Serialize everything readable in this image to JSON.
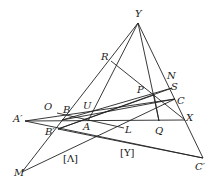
{
  "diagram": {
    "labels": {
      "Y": "Y",
      "R": "R",
      "N": "N",
      "S": "S",
      "C": "C",
      "P": "P",
      "X": "X",
      "Q": "Q",
      "O": "O",
      "B": "B",
      "U": "U",
      "A": "A",
      "A_prime": "A′",
      "B_prime": "B′",
      "L": "L",
      "M": "M",
      "C_prime": "C′",
      "Lambda": "[Λ]",
      "Upsilon": "[Υ]"
    },
    "points": {
      "Y": [
        138,
        23
      ],
      "R": [
        111,
        61
      ],
      "N": [
        169,
        83
      ],
      "S": [
        172,
        88
      ],
      "C": [
        175,
        99
      ],
      "P": [
        154,
        95
      ],
      "X": [
        185,
        120
      ],
      "Q": [
        159,
        121
      ],
      "B": [
        66,
        118
      ],
      "U": [
        91,
        114
      ],
      "A": [
        88,
        121
      ],
      "A_prime": [
        25,
        121
      ],
      "B_prime": [
        58,
        129
      ],
      "M": [
        22,
        172
      ],
      "C_prime": [
        203,
        158
      ],
      "O_end": [
        57,
        117
      ],
      "L_end": [
        124,
        125
      ]
    },
    "line_color": "#222222"
  }
}
